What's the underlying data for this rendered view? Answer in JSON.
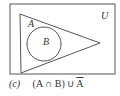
{
  "diagram": {
    "universe_label": "U",
    "set_a_label": "A",
    "set_b_label": "B",
    "stroke_color": "#555555"
  },
  "caption": {
    "part_label": "(c)",
    "expr_main": "(A ∩ B) ∪ ",
    "expr_complement": "A"
  }
}
